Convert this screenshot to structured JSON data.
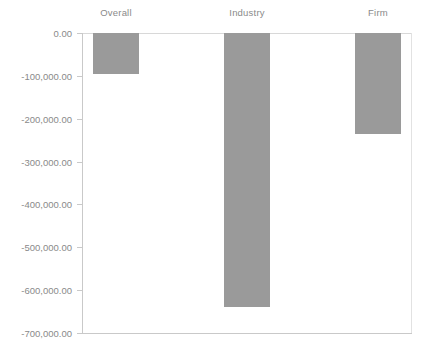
{
  "chart_data": {
    "type": "bar",
    "title": "",
    "subtitle": "",
    "xlabel": "",
    "ylabel": "",
    "categories": [
      "Overall",
      "Industry",
      "Firm"
    ],
    "values": [
      -95000,
      -640000,
      -235000
    ],
    "series": [
      {
        "name": "",
        "values": [
          -95000,
          -640000,
          -235000
        ]
      }
    ],
    "ylim": [
      -700000,
      0
    ],
    "ytick_values": [
      0,
      -100000,
      -200000,
      -300000,
      -400000,
      -500000,
      -600000,
      -700000
    ],
    "ytick_labels": [
      "0.00",
      "-100,000.00",
      "-200,000.00",
      "-300,000.00",
      "-400,000.00",
      "-500,000.00",
      "-600,000.00",
      "-700,000.00"
    ],
    "grid": false,
    "legend": false,
    "legend_position": "none",
    "category_label_position": "top",
    "annotations": [],
    "colors": {
      "bar_fill": "#9a9a9a",
      "axis_line": "#c9c9c9",
      "zero_line": "#d8d8d8",
      "plot_border": "#e2e2e2",
      "tick_label_text": "#8a8a8a",
      "category_label_text": "#8a8a8a",
      "background": "#ffffff"
    }
  }
}
